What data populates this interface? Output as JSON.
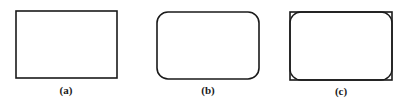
{
  "figures": [
    {
      "label": "(a)",
      "shape": "rectangle",
      "x": 16,
      "y": 11,
      "w": 101,
      "h": 67,
      "rx": 0
    },
    {
      "label": "(b)",
      "shape": "rounded-rectangle",
      "x": 157,
      "y": 12,
      "w": 102,
      "h": 67,
      "rx": 11
    },
    {
      "label": "(c)",
      "shape": "rectangle-with-inscribed-rounded-rectangle",
      "x": 290,
      "y": 12,
      "w": 102,
      "h": 68,
      "rx": 11
    }
  ],
  "colors": {
    "stroke": "#1a1a1a",
    "background": "#ffffff"
  }
}
